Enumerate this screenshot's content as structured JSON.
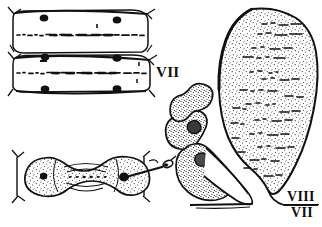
{
  "figure": {
    "kind": "scientific-line-drawing",
    "background_color": "#ffffff",
    "ink_color": "#111111",
    "stipple_color": "#1a1a1a"
  },
  "labels": {
    "left_segment_label": "VII",
    "right_upper_label": "VIII",
    "right_lower_label": "VII"
  },
  "panels": [
    {
      "name": "upper-left-segments",
      "description": "two stacked rectangular abdominal segments with dark setal nodes and median dashed rows",
      "segment_count": 2,
      "node_count": 10,
      "label": "VII"
    },
    {
      "name": "lower-left-dumbbell",
      "description": "dumbbell shaped sclerite, two stippled lobes joined by narrow waist, pin pointer at right",
      "lobe_count": 2,
      "pointer": "pin-needle"
    },
    {
      "name": "right-lateral-view",
      "description": "large stippled ovoid segment with lobed claspers at lower left, baseline bar",
      "labels": [
        "VIII",
        "VII"
      ]
    }
  ]
}
